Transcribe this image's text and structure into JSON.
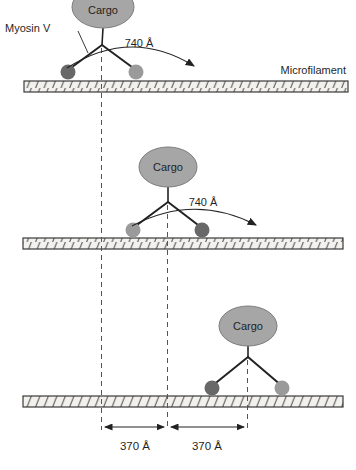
{
  "figure": {
    "cargo_label": "Cargo",
    "myosin_label": "Myosin V",
    "microfilament_label": "Microfilament",
    "head_step_label": "740 Å",
    "center_step_label": "370 Å"
  },
  "colors": {
    "background": "#ffffff",
    "text": "#1f1f1f",
    "line": "#222222",
    "dash": "#555555",
    "cargo-fill": "#a6a6a6",
    "cargo-stroke": "#7d7d7d",
    "foot-dark": "#686868",
    "foot-light": "#9a9a9a",
    "filament-fill": "#f2f1ed",
    "filament-stroke": "#3a3a3a",
    "hatch": "#4f4f4f"
  }
}
